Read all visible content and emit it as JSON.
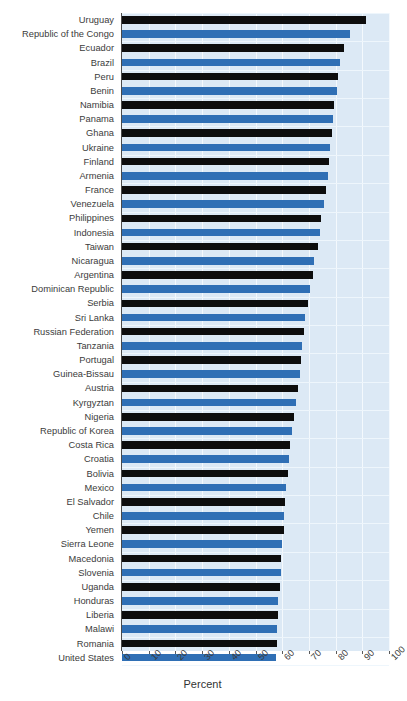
{
  "chart_data": {
    "type": "bar",
    "orientation": "horizontal",
    "title": "",
    "xlabel": "Percent",
    "ylabel": "",
    "xlim": [
      0,
      100
    ],
    "xticks": [
      0,
      10,
      20,
      30,
      40,
      50,
      60,
      70,
      80,
      90,
      100
    ],
    "xtick_labels": [
      "0",
      "10",
      "20",
      "30",
      "40",
      "50",
      "60",
      "70",
      "80",
      "90",
      "100"
    ],
    "grid": true,
    "legend": "none",
    "bar_colors": [
      "#0d0d0d",
      "#2f6fb5"
    ],
    "plot_background": "#dce9f5",
    "categories": [
      "Uruguay",
      "Republic of the Congo",
      "Ecuador",
      "Brazil",
      "Peru",
      "Benin",
      "Namibia",
      "Panama",
      "Ghana",
      "Ukraine",
      "Finland",
      "Armenia",
      "France",
      "Venezuela",
      "Philippines",
      "Indonesia",
      "Taiwan",
      "Nicaragua",
      "Argentina",
      "Dominican Republic",
      "Serbia",
      "Sri Lanka",
      "Russian Federation",
      "Tanzania",
      "Portugal",
      "Guinea-Bissau",
      "Austria",
      "Kyrgyztan",
      "Nigeria",
      "Republic of Korea",
      "Costa Rica",
      "Croatia",
      "Bolivia",
      "Mexico",
      "El Salvador",
      "Chile",
      "Yemen",
      "Sierra Leone",
      "Macedonia",
      "Slovenia",
      "Uganda",
      "Honduras",
      "Liberia",
      "Malawi",
      "Romania",
      "United States"
    ],
    "values": [
      91.5,
      85.5,
      83.0,
      81.5,
      81.0,
      80.5,
      79.5,
      79.0,
      78.5,
      78.0,
      77.5,
      77.0,
      76.5,
      75.5,
      74.5,
      74.0,
      73.5,
      72.0,
      71.5,
      70.5,
      69.5,
      68.5,
      68.0,
      67.5,
      67.0,
      66.5,
      66.0,
      65.0,
      64.5,
      63.5,
      63.0,
      62.5,
      62.0,
      61.5,
      61.0,
      60.5,
      60.5,
      60.0,
      59.5,
      59.5,
      59.0,
      58.5,
      58.5,
      58.0,
      58.0,
      57.5
    ]
  }
}
